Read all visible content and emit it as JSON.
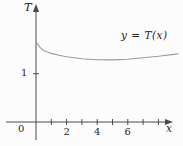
{
  "figure": {
    "background": "#fcfcfc",
    "axis_color": "#4a4a4a",
    "curve_color": "#9b9b9b",
    "text_color": "#1f1f1f"
  },
  "chart_data": {
    "type": "line",
    "title": "",
    "xlabel": "x",
    "ylabel": "T",
    "origin_label": "0",
    "curve_label": "y = T(x)",
    "grid": false,
    "legend": "inline-annotation",
    "xlim": [
      0,
      9.6
    ],
    "ylim": [
      0,
      2.35
    ],
    "x_ticks": [
      1,
      2,
      3,
      4,
      5,
      6,
      7,
      8
    ],
    "x_labeled_ticks": [
      2,
      4,
      6
    ],
    "y_ticks": [
      1
    ],
    "series": [
      {
        "name": "y = T(x)",
        "x": [
          0,
          0.1,
          0.25,
          0.5,
          0.75,
          1,
          1.5,
          2,
          2.5,
          3,
          4,
          5,
          6,
          7,
          8,
          9,
          9.3
        ],
        "y": [
          1.67,
          1.61,
          1.55,
          1.48,
          1.45,
          1.42,
          1.38,
          1.35,
          1.33,
          1.31,
          1.29,
          1.285,
          1.3,
          1.33,
          1.36,
          1.4,
          1.415
        ]
      }
    ]
  }
}
